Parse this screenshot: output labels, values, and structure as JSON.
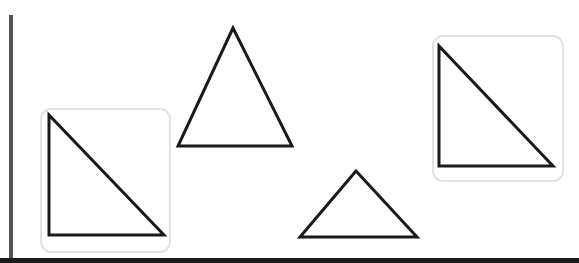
{
  "canvas": {
    "width": 579,
    "height": 263,
    "background": "#ffffff"
  },
  "colors": {
    "stroke": "#1a1a1a",
    "box_border": "#e2e2e2",
    "left_rule": "#555555",
    "bottom_rule": "#1a1a1a"
  },
  "shapes": [
    {
      "id": "right-triangle-boxed-left",
      "type": "right-triangle",
      "boxed": true,
      "box": {
        "x": 40,
        "y": 108,
        "w": 131,
        "h": 145
      },
      "points": "49,115 49,235 164,235"
    },
    {
      "id": "tall-isosceles-triangle",
      "type": "isosceles-triangle",
      "boxed": false,
      "points": "233,28 178,146 292,146"
    },
    {
      "id": "right-triangle-boxed-right",
      "type": "right-triangle",
      "boxed": true,
      "box": {
        "x": 432,
        "y": 35,
        "w": 132,
        "h": 147
      },
      "points": "439,46 439,166 553,166"
    },
    {
      "id": "short-isosceles-triangle",
      "type": "isosceles-triangle",
      "boxed": false,
      "points": "356,171 300,237 417,237"
    }
  ]
}
